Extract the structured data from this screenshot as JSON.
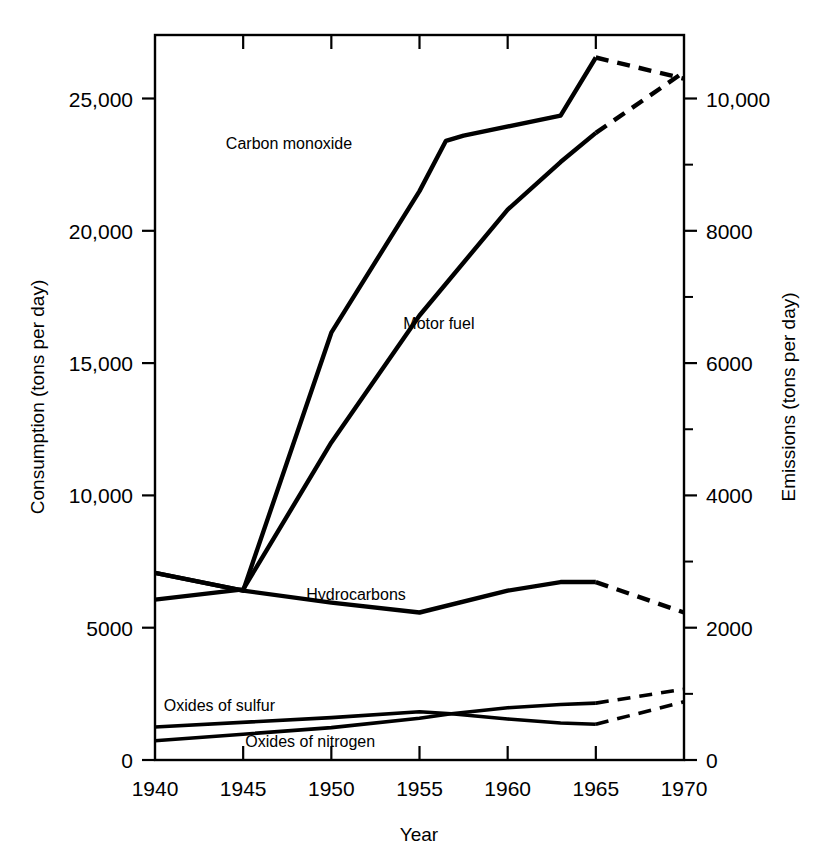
{
  "chart_data": {
    "type": "line",
    "title": "",
    "xlabel": "Year",
    "ylabel": "Consumption (tons per day)",
    "y2label": "Emissions (tons per day)",
    "xlim": [
      1940,
      1970
    ],
    "ylim": [
      0,
      27400
    ],
    "y2lim": [
      0,
      10960
    ],
    "grid": false,
    "legend": "inline-annotations",
    "x_ticks": [
      "1940",
      "1945",
      "1950",
      "1955",
      "1960",
      "1965",
      "1970"
    ],
    "x_tick_values": [
      1940,
      1945,
      1950,
      1955,
      1960,
      1965,
      1970
    ],
    "y_ticks": [
      "0",
      "5000",
      "10,000",
      "15,000",
      "20,000",
      "25,000"
    ],
    "y_tick_values": [
      0,
      5000,
      10000,
      15000,
      20000,
      25000
    ],
    "y2_ticks": [
      "0",
      "2000",
      "4000",
      "6000",
      "8000",
      "10,000"
    ],
    "y2_tick_values": [
      0,
      2000,
      4000,
      6000,
      8000,
      10000
    ],
    "y2_minor_tick_values": [
      1000,
      3000,
      5000,
      7000,
      9000
    ],
    "series": [
      {
        "name": "Carbon monoxide",
        "axis": "right",
        "label_position": {
          "x": 1947.6,
          "y": 23100
        },
        "solid_x": [
          1940,
          1945,
          1950,
          1955,
          1956.5,
          1957.5,
          1963,
          1965
        ],
        "solid_y": [
          2830,
          2560,
          6460,
          8600,
          9360,
          9440,
          9740,
          10620
        ],
        "dashed_x": [
          1965,
          1970
        ],
        "dashed_y": [
          10620,
          10300
        ]
      },
      {
        "name": "Motor fuel",
        "axis": "left",
        "label_position": {
          "x": 1956.1,
          "y": 16300
        },
        "solid_x": [
          1940,
          1945,
          1950,
          1955,
          1960,
          1963,
          1965
        ],
        "solid_y": [
          6060,
          6450,
          12000,
          16800,
          20800,
          22600,
          23700
        ],
        "dashed_x": [
          1965,
          1970
        ],
        "dashed_y": [
          23700,
          26000
        ]
      },
      {
        "name": "Hydrocarbons",
        "axis": "right",
        "label_position": {
          "x": 1951.4,
          "y": 6060
        },
        "solid_x": [
          1940,
          1945,
          1950,
          1955,
          1960,
          1963,
          1965
        ],
        "solid_y": [
          2830,
          2560,
          2380,
          2230,
          2560,
          2690,
          2690
        ],
        "dashed_x": [
          1965,
          1970
        ],
        "dashed_y": [
          2690,
          2230
        ]
      },
      {
        "name": "Oxides of sulfur",
        "axis": "right",
        "label_position": {
          "x": 1940.5,
          "y": 1850
        },
        "solid_x": [
          1940,
          1950,
          1955,
          1956.8,
          1960,
          1963,
          1965
        ],
        "solid_y": [
          500,
          640,
          730,
          700,
          620,
          560,
          540
        ],
        "dashed_x": [
          1965,
          1970
        ],
        "dashed_y": [
          540,
          880
        ]
      },
      {
        "name": "Oxides of nitrogen",
        "axis": "right",
        "label_position": {
          "x": 1948.8,
          "y": 480
        },
        "solid_x": [
          1940,
          1945,
          1950,
          1955,
          1956.8,
          1960,
          1963,
          1965
        ],
        "solid_y": [
          290,
          390,
          490,
          630,
          700,
          790,
          840,
          860
        ],
        "dashed_x": [
          1965,
          1970
        ],
        "dashed_y": [
          860,
          1070
        ]
      }
    ],
    "annotations": [
      "Carbon monoxide",
      "Motor fuel",
      "Hydrocarbons",
      "Oxides of sulfur",
      "Oxides of nitrogen"
    ]
  }
}
